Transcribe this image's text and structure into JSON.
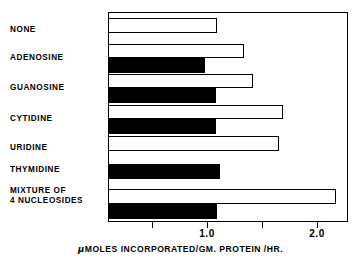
{
  "chart_data": {
    "type": "bar",
    "orientation": "horizontal",
    "title": "",
    "xlabel": "μMOLES INCORPORATED/GM. PROTEIN /HR.",
    "ylabel": "",
    "xlim": [
      0.0,
      2.28
    ],
    "xticks": [
      0.5,
      1.0,
      1.5,
      2.0
    ],
    "xtick_labels": [
      "",
      "1.0",
      "",
      "2.0"
    ],
    "grid": false,
    "legend": "none",
    "categories": [
      "NONE",
      "ADENOSINE",
      "GUANOSINE",
      "CYTIDINE",
      "URIDINE",
      "THYMIDINE",
      "MIXTURE OF\n4 NUCLEOSIDES"
    ],
    "series": [
      {
        "name": "open",
        "style": "white-outlined",
        "values": [
          1.09,
          1.34,
          1.42,
          1.69,
          1.65,
          null,
          2.17
        ]
      },
      {
        "name": "filled",
        "style": "black-solid",
        "values": [
          null,
          0.98,
          1.08,
          1.08,
          null,
          1.12,
          1.09
        ]
      }
    ],
    "bars": [
      {
        "category": "NONE",
        "open": 1.09,
        "filled": null
      },
      {
        "category": "ADENOSINE",
        "open": 1.34,
        "filled": 0.98
      },
      {
        "category": "GUANOSINE",
        "open": 1.42,
        "filled": 1.08
      },
      {
        "category": "CYTIDINE",
        "open": 1.69,
        "filled": 1.08
      },
      {
        "category": "URIDINE",
        "open": 1.65,
        "filled": null
      },
      {
        "category": "THYMIDINE",
        "open": null,
        "filled": 1.12
      },
      {
        "category": "MIXTURE OF 4 NUCLEOSIDES",
        "open": 2.17,
        "filled": 1.09
      }
    ]
  },
  "axis": {
    "caption_mu": "μ",
    "caption_rest": "MOLES INCORPORATED/GM. PROTEIN /HR.",
    "tick_1": "1.0",
    "tick_2": "2.0"
  },
  "labels": {
    "none": "NONE",
    "adenosine": "ADENOSINE",
    "guanosine": "GUANOSINE",
    "cytidine": "CYTIDINE",
    "uridine": "URIDINE",
    "thymidine": "THYMIDINE",
    "mixture": "MIXTURE OF\n4 NUCLEOSIDES"
  },
  "colors": {
    "open_bar_fill": "#ffffff",
    "open_bar_stroke": "#000000",
    "filled_bar": "#000000",
    "frame": "#000000",
    "background": "#ffffff"
  }
}
